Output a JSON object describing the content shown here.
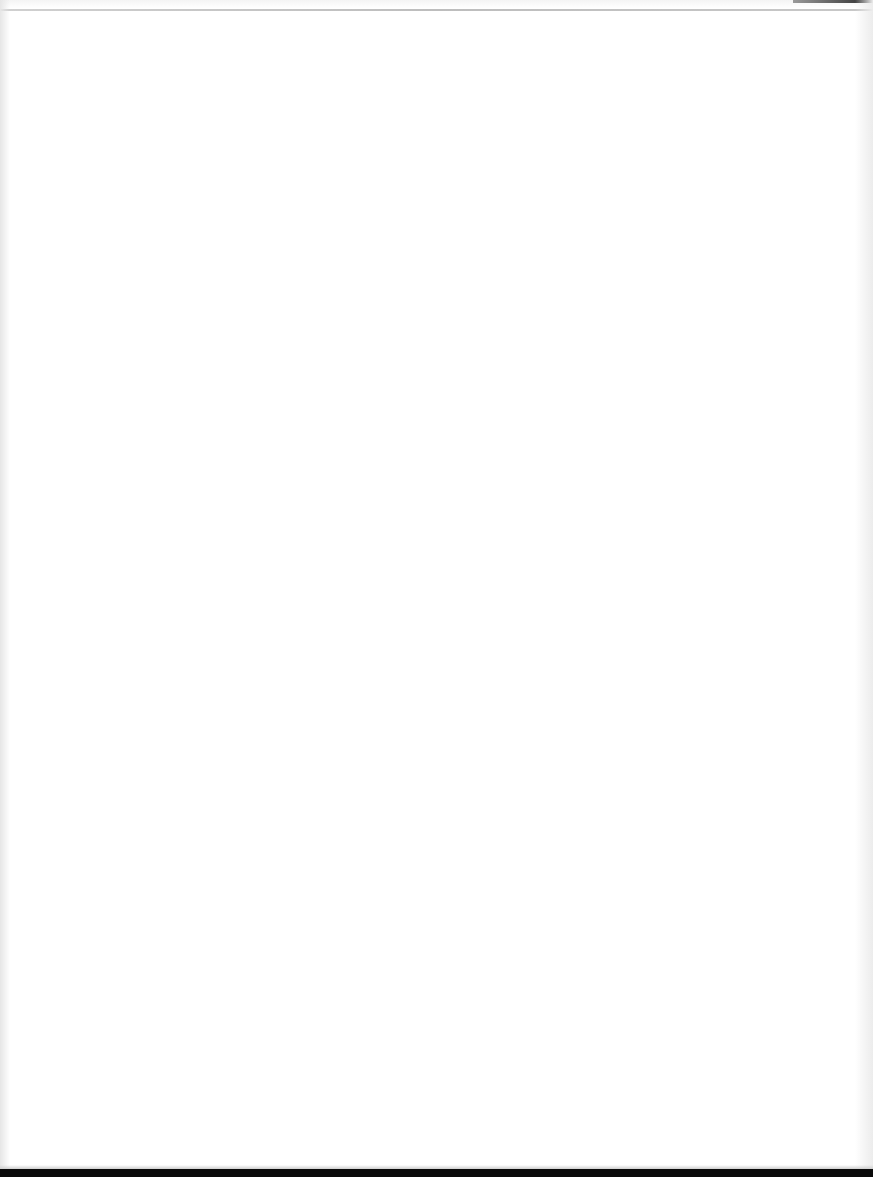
{
  "document": {
    "type": "blank scanned page",
    "page_text": "",
    "colors": {
      "paper": "#ffffff",
      "top_rule": "#c4c4c4",
      "bottom_band": "#0a0a0a",
      "edge_shade": "#e6e6e6"
    }
  }
}
